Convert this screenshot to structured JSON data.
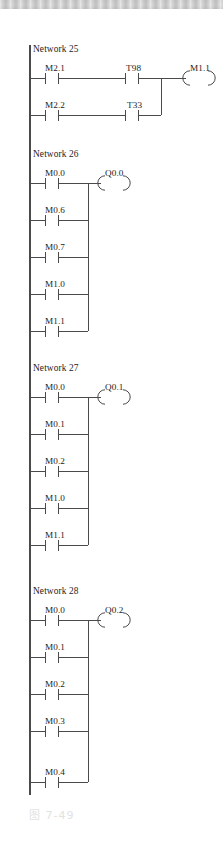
{
  "page": {
    "caption": "图 7-49",
    "caption_color": "#e2e2e2",
    "background_color": "#ffffff",
    "line_color": "#4a4a4a",
    "text_color": "#1c1c1c",
    "top_bar_color": "#cccccc"
  },
  "diagram": {
    "type": "ladder-logic",
    "rail_x": 30,
    "networks": [
      {
        "id": "network-25",
        "label": "Network 25",
        "label_x": 33,
        "label_y": 45,
        "join_x": 161,
        "coil": {
          "name": "M1.1",
          "x": 186,
          "y": 78,
          "label_x": 190,
          "label_y": 64
        },
        "rungs": [
          {
            "y": 78,
            "contacts": [
              {
                "name": "M2.1",
                "x": 45,
                "label_x": 45,
                "label_y": 64
              },
              {
                "name": "T98",
                "x": 125,
                "label_x": 126,
                "label_y": 64
              }
            ]
          },
          {
            "y": 115,
            "contacts": [
              {
                "name": "M2.2",
                "x": 45,
                "label_x": 45,
                "label_y": 101
              },
              {
                "name": "T33",
                "x": 125,
                "label_x": 127,
                "label_y": 101
              }
            ]
          }
        ]
      },
      {
        "id": "network-26",
        "label": "Network 26",
        "label_x": 33,
        "label_y": 150,
        "join_x": 88,
        "coil": {
          "name": "Q0.0",
          "x": 101,
          "y": 183,
          "label_x": 105,
          "label_y": 169
        },
        "rungs": [
          {
            "y": 183,
            "contacts": [
              {
                "name": "M0.0",
                "x": 45,
                "label_x": 45,
                "label_y": 169
              }
            ]
          },
          {
            "y": 220,
            "contacts": [
              {
                "name": "M0.6",
                "x": 45,
                "label_x": 45,
                "label_y": 206
              }
            ]
          },
          {
            "y": 257,
            "contacts": [
              {
                "name": "M0.7",
                "x": 45,
                "label_x": 45,
                "label_y": 243
              }
            ]
          },
          {
            "y": 294,
            "contacts": [
              {
                "name": "M1.0",
                "x": 45,
                "label_x": 45,
                "label_y": 280
              }
            ]
          },
          {
            "y": 331,
            "contacts": [
              {
                "name": "M1.1",
                "x": 45,
                "label_x": 45,
                "label_y": 317
              }
            ]
          }
        ]
      },
      {
        "id": "network-27",
        "label": "Network 27",
        "label_x": 33,
        "label_y": 364,
        "join_x": 88,
        "coil": {
          "name": "Q0.1",
          "x": 101,
          "y": 397,
          "label_x": 105,
          "label_y": 383
        },
        "rungs": [
          {
            "y": 397,
            "contacts": [
              {
                "name": "M0.0",
                "x": 45,
                "label_x": 45,
                "label_y": 383
              }
            ]
          },
          {
            "y": 434,
            "contacts": [
              {
                "name": "M0.1",
                "x": 45,
                "label_x": 45,
                "label_y": 420
              }
            ]
          },
          {
            "y": 471,
            "contacts": [
              {
                "name": "M0.2",
                "x": 45,
                "label_x": 45,
                "label_y": 457
              }
            ]
          },
          {
            "y": 508,
            "contacts": [
              {
                "name": "M1.0",
                "x": 45,
                "label_x": 45,
                "label_y": 494
              }
            ]
          },
          {
            "y": 545,
            "contacts": [
              {
                "name": "M1.1",
                "x": 45,
                "label_x": 45,
                "label_y": 531
              }
            ]
          }
        ]
      },
      {
        "id": "network-28",
        "label": "Network 28",
        "label_x": 33,
        "label_y": 587,
        "join_x": 88,
        "coil": {
          "name": "Q0.2",
          "x": 101,
          "y": 620,
          "label_x": 105,
          "label_y": 606
        },
        "rungs": [
          {
            "y": 620,
            "contacts": [
              {
                "name": "M0.0",
                "x": 45,
                "label_x": 45,
                "label_y": 606
              }
            ]
          },
          {
            "y": 657,
            "contacts": [
              {
                "name": "M0.1",
                "x": 45,
                "label_x": 45,
                "label_y": 643
              }
            ]
          },
          {
            "y": 694,
            "contacts": [
              {
                "name": "M0.2",
                "x": 45,
                "label_x": 45,
                "label_y": 680
              }
            ]
          },
          {
            "y": 731,
            "contacts": [
              {
                "name": "M0.3",
                "x": 45,
                "label_x": 45,
                "label_y": 717
              }
            ]
          },
          {
            "y": 782,
            "contacts": [
              {
                "name": "M0.4",
                "x": 45,
                "label_x": 45,
                "label_y": 768
              }
            ]
          }
        ]
      }
    ]
  }
}
